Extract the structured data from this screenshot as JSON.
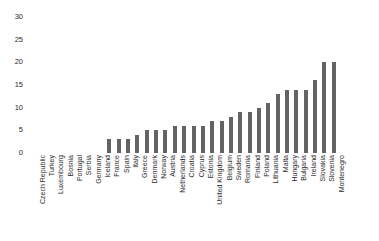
{
  "chart_data": {
    "type": "bar",
    "title": "",
    "subtitle": "",
    "xlabel": "",
    "ylabel": "",
    "ylim": [
      0,
      30
    ],
    "yticks": [
      0,
      5,
      10,
      15,
      20,
      25,
      30
    ],
    "grid": false,
    "legend": null,
    "orientation": "vertical",
    "bar_color": "#636363",
    "background_color": "#ffffff",
    "text_color": "#2b2b2b",
    "categories": [
      "Czech Republic",
      "Turkey",
      "Luxembourg",
      "Bosnia",
      "Portugal",
      "Serbia",
      "Germany",
      "Iceland",
      "France",
      "Spain",
      "Italy",
      "Greece",
      "Denmark",
      "Norway",
      "Austria",
      "Netherlands",
      "Croatia",
      "Cyprus",
      "Estonia",
      "United Kingdom",
      "Belgium",
      "Sweden",
      "Romania",
      "Finland",
      "Poland",
      "Lithuania",
      "Malta",
      "Hungary",
      "Bulgaria",
      "Ireland",
      "Slovakia",
      "Slovenia",
      "Montenegro"
    ],
    "values": [
      0,
      0,
      0,
      0,
      0,
      0,
      0,
      0,
      3,
      3,
      3,
      4,
      5,
      5,
      5,
      6,
      6,
      6,
      6,
      7,
      7,
      8,
      9,
      9,
      10,
      11,
      13,
      14,
      14,
      14,
      16,
      20,
      20
    ]
  }
}
